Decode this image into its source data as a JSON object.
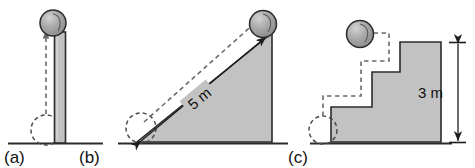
{
  "figure": {
    "background_color": "#ffffff",
    "body_fill_color": "#c2c2c2",
    "body_outline_color": "#2b2b2b",
    "ghost_color": "#6a6a6a",
    "dimension_color": "#1d1d1d",
    "ball_fill_color": "#9a9a9a",
    "ball_shadow_color": "#2f2f2f"
  },
  "panels": [
    {
      "id": "a",
      "label": "(a)",
      "shape_name": "vertical-pillar",
      "ball_name": "sphere-on-pillar",
      "ghost_name": "dashed-start-circle-at-ground",
      "path_name": "dashed-vertical-lift-path",
      "dimension": null
    },
    {
      "id": "b",
      "label": "(b)",
      "shape_name": "inclined-ramp",
      "ball_name": "sphere-on-ramp-top",
      "ghost_name": "dashed-start-circle-at-ramp-base",
      "path_name": "dashed-incline-path",
      "dimension": {
        "label": "5 m",
        "value": 5,
        "unit": "m",
        "measures": "ramp-incline-length",
        "orientation": "diagonal",
        "arrow_style": "double-headed"
      }
    },
    {
      "id": "c",
      "label": "(c)",
      "shape_name": "three-step-staircase",
      "ball_name": "sphere-on-top-step",
      "ghost_name": "dashed-start-circle-at-ground",
      "path_name": "dashed-staircase-path",
      "dimension": {
        "label": "3 m",
        "value": 3,
        "unit": "m",
        "measures": "staircase-total-height",
        "orientation": "vertical",
        "arrow_style": "double-headed"
      }
    }
  ]
}
